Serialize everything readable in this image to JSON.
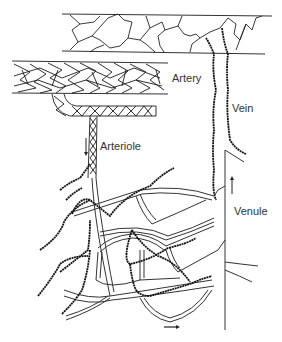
{
  "diagram": {
    "title": "",
    "labels": {
      "artery": "Artery",
      "vein": "Vein",
      "arteriole": "Arteriole",
      "venule": "Venule"
    },
    "arrows": {
      "arteriole_flow": "down-arrow",
      "venule_flow": "up-arrow",
      "capillary_flow": "right-arrow"
    },
    "colors": {
      "line": "#222222",
      "background": "#ffffff"
    }
  }
}
